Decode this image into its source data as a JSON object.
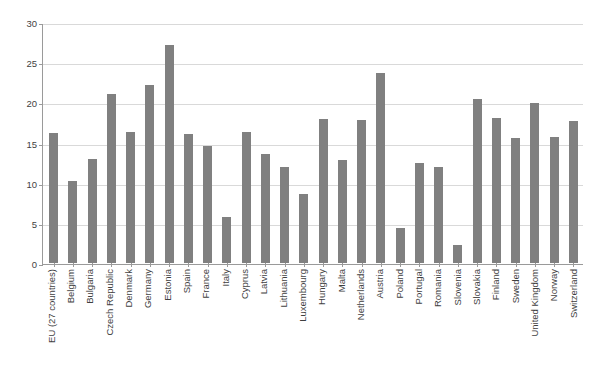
{
  "chart_data": {
    "type": "bar",
    "title": "",
    "xlabel": "",
    "ylabel": "",
    "ylim": [
      0,
      30
    ],
    "yticks": [
      0,
      5,
      10,
      15,
      20,
      25,
      30
    ],
    "grid": true,
    "legend": false,
    "legend_position": "none",
    "orientation": "vertical",
    "label_rotation": -90,
    "bar_color": "#808080",
    "grid_color": "#d9d9d9",
    "axis_color": "#9a9a9a",
    "text_color": "#3f3f3f",
    "background": "#ffffff",
    "categories": [
      "EU (27 countries)",
      "Belgium",
      "Bulgaria",
      "Czech Republic",
      "Denmark",
      "Germany",
      "Estonia",
      "Spain",
      "France",
      "Italy",
      "Cyprus",
      "Latvia",
      "Lithuania",
      "Luxembourg",
      "Hungary",
      "Malta",
      "Netherlands",
      "Austria",
      "Poland",
      "Portugal",
      "Romania",
      "Slovenia",
      "Slovakia",
      "Finland",
      "Sweden",
      "United Kingdom",
      "Norway",
      "Switzerland"
    ],
    "values": [
      16.2,
      10.2,
      13.0,
      21.0,
      16.3,
      22.1,
      27.2,
      16.1,
      14.6,
      5.7,
      16.3,
      13.6,
      11.9,
      8.6,
      17.9,
      12.8,
      17.8,
      23.6,
      4.4,
      12.4,
      12.0,
      2.2,
      20.4,
      18.0,
      15.6,
      19.9,
      15.7,
      17.7
    ]
  }
}
